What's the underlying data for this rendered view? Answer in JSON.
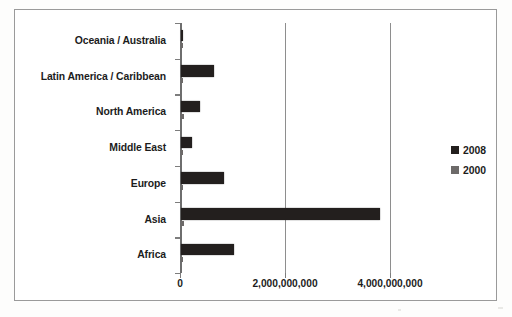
{
  "chart_data": {
    "type": "bar",
    "orientation": "horizontal",
    "title": "",
    "xlabel": "",
    "ylabel": "",
    "categories": [
      "Oceania / Australia",
      "Latin America / Caribbean",
      "North America",
      "Middle East",
      "Europe",
      "Asia",
      "Africa"
    ],
    "series": [
      {
        "name": "2008",
        "color": "#231f1e",
        "values": [
          34000000,
          630000000,
          360000000,
          210000000,
          820000000,
          3790000000,
          1000000000
        ]
      },
      {
        "name": "2000",
        "color": "#6d6a69",
        "values": [
          6000000,
          28000000,
          55000000,
          20000000,
          42000000,
          60000000,
          12000000
        ]
      }
    ],
    "xlim": [
      0,
      4300000000
    ],
    "xticks": [
      0,
      2000000000,
      4000000000
    ],
    "xtick_labels": [
      "0",
      "2,000,000,000",
      "4,000,000,000"
    ],
    "grid": true,
    "legend_position": "right",
    "legend_entries": [
      "2008",
      "2000"
    ]
  },
  "legend": {
    "items": [
      {
        "label": "2008",
        "swatch": "legend-swatch-2008"
      },
      {
        "label": "2000",
        "swatch": "legend-swatch-2000"
      }
    ]
  },
  "colors": {
    "series_2008": "#231f1e",
    "series_2000": "#6d6a69",
    "frame": "#9a9a9a",
    "axis": "#7d7d7d",
    "text": "#1c1c1c",
    "background": "#ffffff"
  }
}
